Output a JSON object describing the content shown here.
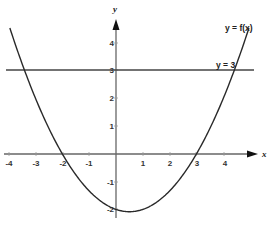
{
  "chart_data": {
    "type": "line",
    "title": "",
    "xlabel": "x",
    "ylabel": "y",
    "xlim": [
      -4.2,
      5.3
    ],
    "ylim": [
      -2.3,
      5.0
    ],
    "grid": false,
    "x_ticks": [
      -4,
      -3,
      -2,
      -1,
      1,
      2,
      3,
      4
    ],
    "y_ticks": [
      -2,
      -1,
      1,
      2,
      3,
      4
    ],
    "series": [
      {
        "name": "y = f(x)",
        "description": "Upward parabola with roots at x = -2 and x = 3, vertex near (0.5, -2.08), y-intercept about -2",
        "x": [
          -3.96,
          -3.41,
          -3,
          -2,
          -1,
          0,
          0.5,
          1,
          2,
          3,
          4,
          4.41,
          4.96
        ],
        "y": [
          4.55,
          3,
          2,
          0,
          -1.33,
          -2,
          -2.08,
          -2,
          -1.33,
          0,
          2,
          3,
          4.6
        ]
      },
      {
        "name": "y = 3",
        "description": "Horizontal line",
        "x": [
          -4.1,
          5.2
        ],
        "y": [
          3,
          3
        ]
      }
    ],
    "annotations": [
      {
        "text": "y = f(x)",
        "x": 4.5,
        "y": 4.5
      },
      {
        "text": "y = 3",
        "x": 4.0,
        "y": 3.2
      }
    ],
    "intersections_with_y3": [
      -3.41,
      4.41
    ],
    "x_intercepts": [
      -2,
      3
    ]
  },
  "labels": {
    "x_axis": "x",
    "y_axis": "y",
    "curve": "y = f(x)",
    "line": "y = 3",
    "x_ticks": [
      "-4",
      "-3",
      "-2",
      "-1",
      "1",
      "2",
      "3",
      "4"
    ],
    "y_ticks": [
      "4",
      "3",
      "2",
      "1",
      "-1",
      "-2"
    ]
  }
}
